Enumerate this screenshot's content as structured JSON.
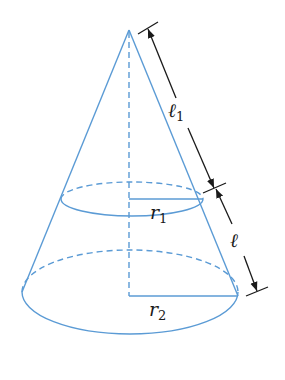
{
  "diagram": {
    "type": "frustum-of-cone",
    "colors": {
      "cone": "#5b9bd5",
      "dimension": "#1a1a1a",
      "background": "#ffffff"
    },
    "labels": {
      "l1": {
        "main": "ℓ",
        "sub": "1"
      },
      "l": {
        "main": "ℓ",
        "sub": ""
      },
      "r1": {
        "main": "r",
        "sub": "1"
      },
      "r2": {
        "main": "r",
        "sub": "2"
      }
    }
  }
}
